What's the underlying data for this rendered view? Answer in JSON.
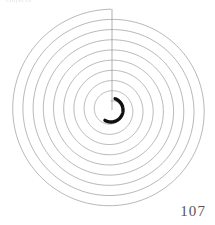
{
  "page": {
    "folio": "107",
    "running_head": "Objects",
    "background_color": "#ffffff",
    "width": 215,
    "height": 225
  },
  "plate": {
    "title": "archimedean-spiral-plate",
    "ink_color": "#8a8a8a",
    "heavy_ink_color": "#111111",
    "radial_line_color": "#8f8f8f",
    "center": {
      "x": 111,
      "y": 110
    },
    "turns": 9,
    "outer_radius": 101,
    "inner_radius": 9,
    "radial_line": {
      "label": "radial-cut-line",
      "x": 112,
      "y_top": 9,
      "y_bottom": 110
    },
    "heavy_arc": {
      "label": "center-ink-blot-arc",
      "radius": 12,
      "start_angle_deg": -70,
      "end_angle_deg": 120,
      "stroke_width": 3.4
    }
  },
  "chart_data": {
    "type": "line",
    "subtitle": "",
    "xlabel": "",
    "ylabel": "",
    "grid": false,
    "legend": false,
    "annotations": [
      "107"
    ],
    "spiral": {
      "equation": "r = a + b*theta",
      "a": 9,
      "b": 10.2,
      "theta_start_deg": 0,
      "theta_end_deg": 3240,
      "turns": 9,
      "center_x": 111,
      "center_y": 110,
      "r_min": 9,
      "r_max": 101
    },
    "radii_at_turn": [
      9,
      19,
      30,
      40,
      51,
      61,
      71,
      81,
      91,
      101
    ],
    "series": [
      {
        "name": "spiral-curve",
        "values": [
          9,
          19,
          30,
          40,
          51,
          61,
          71,
          81,
          91,
          101
        ]
      },
      {
        "name": "radial-reference-line",
        "values": [
          0,
          101
        ]
      }
    ]
  }
}
